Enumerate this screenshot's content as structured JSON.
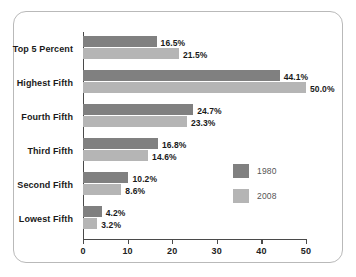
{
  "chart_data": {
    "type": "bar",
    "orientation": "horizontal",
    "title": "",
    "subtitle": "",
    "xlabel": "",
    "ylabel": "",
    "xlim": [
      0,
      50
    ],
    "xticks": [
      0,
      10,
      20,
      30,
      40,
      50
    ],
    "xtick_labels": [
      "0",
      "10",
      "20",
      "30",
      "40",
      "50"
    ],
    "grid": false,
    "legend_position": "inside-right",
    "categories": [
      "Top 5 Percent",
      "Highest Fifth",
      "Fourth Fifth",
      "Third Fifth",
      "Second Fifth",
      "Lowest Fifth"
    ],
    "series": [
      {
        "name": "1980",
        "color": "#808080",
        "values": [
          16.5,
          44.1,
          24.7,
          16.8,
          10.2,
          4.2
        ],
        "labels": [
          "16.5%",
          "44.1%",
          "24.7%",
          "16.8%",
          "10.2%",
          "4.2%"
        ]
      },
      {
        "name": "2008",
        "color": "#b5b5b5",
        "values": [
          21.5,
          50.0,
          23.3,
          14.6,
          8.6,
          3.2
        ],
        "labels": [
          "21.5%",
          "50.0%",
          "23.3%",
          "14.6%",
          "8.6%",
          "3.2%"
        ]
      }
    ]
  },
  "frame": {
    "border_color": "#b9b9b9",
    "background": "#ffffff"
  },
  "axis": {
    "line_color": "#4a4a4a"
  }
}
